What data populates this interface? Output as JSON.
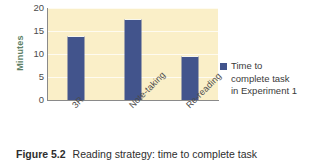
{
  "figure": {
    "caption_label": "Figure 5.2",
    "caption_text": "Reading strategy: time to complete task"
  },
  "legend": {
    "swatch_color": "#42548c",
    "text": "Time to\ncomplete task\nin Experiment 1"
  },
  "colors": {
    "bar": "#42548c",
    "plot_background": "#faefc8",
    "gridline": "#ffffff",
    "axis": "#8a8a8a",
    "y_title": "#5d7f66",
    "tick_text": "#4b4b4b"
  },
  "chart_data": {
    "type": "bar",
    "title": "",
    "xlabel": "",
    "ylabel": "Minutes",
    "categories": [
      "3R",
      "Note-taking",
      "Re-reading"
    ],
    "values": [
      13.6,
      17.4,
      9.3
    ],
    "series": [
      {
        "name": "Time to complete task in Experiment 1",
        "values": [
          13.6,
          17.4,
          9.3
        ]
      }
    ],
    "ylim": [
      0,
      20
    ],
    "yticks": [
      0,
      5,
      10,
      15,
      20
    ],
    "ytick_labels": [
      "0",
      "5",
      "10",
      "15",
      "20"
    ],
    "grid": true,
    "legend_position": "right"
  }
}
